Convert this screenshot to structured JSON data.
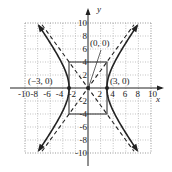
{
  "figure": {
    "type": "hyperbola",
    "equation": "x^2/9 - y^2/16 = 1",
    "axes": {
      "x_label": "x",
      "y_label": "y",
      "x_ticks": [
        "-10",
        "-8",
        "-6",
        "-4",
        "-2",
        "2",
        "4",
        "6",
        "8",
        "10"
      ],
      "y_ticks": [
        "10",
        "8",
        "6",
        "4",
        "2",
        "-2",
        "-4",
        "-6",
        "-8",
        "-10"
      ],
      "range": [
        -10,
        10
      ]
    },
    "points": [
      {
        "label": "(−3, 0)",
        "x": -3,
        "y": 0
      },
      {
        "label": "(3, 0)",
        "x": 3,
        "y": 0
      },
      {
        "label": "(0, 0)",
        "x": 0,
        "y": 0
      }
    ],
    "box": {
      "x": [
        -3,
        3
      ],
      "y": [
        -4,
        4
      ]
    },
    "asymptotes": [
      "y = 4/3 x",
      "y = -4/3 x"
    ],
    "colors": {
      "curve": "#222222",
      "grid": "#9a9a9a",
      "background": "#ffffff"
    }
  }
}
